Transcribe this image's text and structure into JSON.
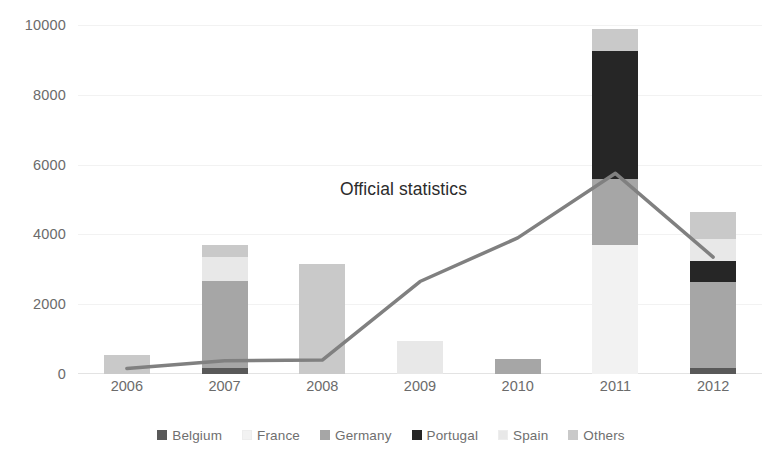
{
  "chart_data": {
    "type": "bar",
    "title": "",
    "subtitle": "",
    "xlabel": "",
    "ylabel": "",
    "ylim": [
      0,
      10000
    ],
    "yticks": [
      0,
      2000,
      4000,
      6000,
      8000,
      10000
    ],
    "ytick_labels": [
      "0",
      "2000",
      "4000",
      "6000",
      "8000",
      "10000"
    ],
    "grid": true,
    "stacked": true,
    "legend_position": "bottom",
    "categories": [
      "2006",
      "2007",
      "2008",
      "2009",
      "2010",
      "2011",
      "2012"
    ],
    "series": [
      {
        "name": "Belgium",
        "color": "#595959",
        "values": [
          0,
          160,
          0,
          0,
          0,
          0,
          180
        ]
      },
      {
        "name": "France",
        "color": "#f2f2f2",
        "values": [
          0,
          0,
          0,
          0,
          0,
          3700,
          0
        ]
      },
      {
        "name": "Germany",
        "color": "#a6a6a6",
        "values": [
          0,
          2500,
          0,
          0,
          420,
          1900,
          2450
        ]
      },
      {
        "name": "Portugal",
        "color": "#262626",
        "values": [
          0,
          0,
          0,
          0,
          0,
          3650,
          620
        ]
      },
      {
        "name": "Spain",
        "color": "#e8e8e8",
        "values": [
          0,
          700,
          0,
          940,
          0,
          0,
          620
        ]
      },
      {
        "name": "Others",
        "color": "#c9c9c9",
        "values": [
          550,
          340,
          3150,
          0,
          0,
          640,
          780
        ]
      }
    ],
    "bar_totals": [
      550,
      3700,
      3150,
      940,
      420,
      9890,
      4650
    ],
    "line_series": {
      "name": "Official statistics",
      "color": "#808080",
      "values": [
        160,
        380,
        400,
        2650,
        3900,
        5750,
        3350
      ]
    },
    "annotations": [
      {
        "text": "Official statistics",
        "x_value": "2009",
        "y_value": 5300
      }
    ]
  },
  "legend": {
    "items": [
      {
        "label": "Belgium",
        "color": "#595959",
        "icon": "legend-swatch-icon"
      },
      {
        "label": "France",
        "color": "#f2f2f2",
        "icon": "legend-swatch-icon"
      },
      {
        "label": "Germany",
        "color": "#a6a6a6",
        "icon": "legend-swatch-icon"
      },
      {
        "label": "Portugal",
        "color": "#262626",
        "icon": "legend-swatch-icon"
      },
      {
        "label": "Spain",
        "color": "#e8e8e8",
        "icon": "legend-swatch-icon"
      },
      {
        "label": "Others",
        "color": "#c9c9c9",
        "icon": "legend-swatch-icon"
      }
    ]
  },
  "colors": {
    "background": "#ffffff",
    "gridline": "#f2f2f2",
    "axis_text": "#6b6b6b",
    "annotation_text": "#2b2b2b",
    "line": "#808080"
  }
}
